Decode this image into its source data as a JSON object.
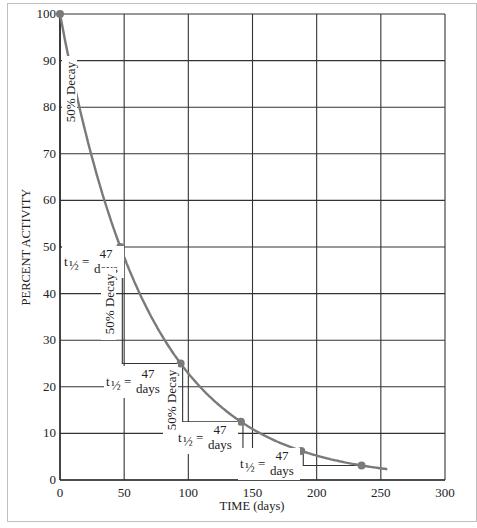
{
  "chart_data": {
    "type": "line",
    "title": "",
    "xlabel": "TIME (days)",
    "ylabel": "PERCENT ACTIVITY",
    "xlim": [
      0,
      300
    ],
    "ylim": [
      0,
      100
    ],
    "grid": true,
    "x_ticks": [
      "0",
      "50",
      "100",
      "150",
      "200",
      "250",
      "300"
    ],
    "y_ticks": [
      "0",
      "10",
      "20",
      "30",
      "40",
      "50",
      "60",
      "70",
      "80",
      "90",
      "100"
    ],
    "series": [
      {
        "name": "Radioactive decay curve",
        "color": "#7a7a7a",
        "half_life_days": 47,
        "marked_points": [
          {
            "x": 0,
            "y": 100
          },
          {
            "x": 47,
            "y": 50
          },
          {
            "x": 94,
            "y": 25
          },
          {
            "x": 141,
            "y": 12.5
          },
          {
            "x": 188,
            "y": 6.25
          },
          {
            "x": 235,
            "y": 3.125
          }
        ],
        "curve_end": {
          "x": 255,
          "y": 2.3
        }
      }
    ],
    "annotations": [
      {
        "text": "50% Decay",
        "orientation": "vertical",
        "near": [
          0,
          75
        ]
      },
      {
        "text": "t½ = 47 days",
        "near": [
          0,
          45
        ]
      },
      {
        "text": "50% Decay",
        "orientation": "vertical",
        "near": [
          47,
          35
        ]
      },
      {
        "text": "t½ = 47 days",
        "near": [
          47,
          22
        ]
      },
      {
        "text": "50% Decay",
        "orientation": "vertical",
        "near": [
          94,
          18
        ]
      },
      {
        "text": "t½ = 47 days",
        "near": [
          94,
          11
        ]
      },
      {
        "text": "t½ = 47 days",
        "near": [
          141,
          5
        ]
      }
    ],
    "legend": null
  },
  "labels": {
    "decay": "50% Decay",
    "t_half": "t",
    "t_half_sub": "½",
    "equals": "=",
    "days_num": "47",
    "days_word": "days"
  }
}
